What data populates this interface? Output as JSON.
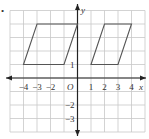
{
  "diagram": {
    "type": "coordinate-grid",
    "bullet": "•",
    "axes": {
      "x_label": "x",
      "y_label": "y",
      "origin_label": "O",
      "x_range": [
        -5,
        5
      ],
      "y_range": [
        -4,
        5
      ],
      "x_ticks": [
        {
          "value": -4,
          "label": "−4"
        },
        {
          "value": -3,
          "label": "−3"
        },
        {
          "value": -2,
          "label": "−2"
        },
        {
          "value": 1,
          "label": "1"
        },
        {
          "value": 2,
          "label": "2"
        },
        {
          "value": 3,
          "label": "3"
        },
        {
          "value": 4,
          "label": "4"
        }
      ],
      "y_ticks": [
        {
          "value": 1,
          "label": "1"
        },
        {
          "value": -2,
          "label": "−2"
        },
        {
          "value": -3,
          "label": "−3"
        }
      ]
    },
    "shapes": [
      {
        "name": "parallelogram-left",
        "vertices": [
          [
            -4,
            1
          ],
          [
            -1,
            1
          ],
          [
            0,
            4
          ],
          [
            -3,
            4
          ]
        ]
      },
      {
        "name": "parallelogram-right",
        "vertices": [
          [
            1,
            1
          ],
          [
            3,
            1
          ],
          [
            4,
            4
          ],
          [
            2,
            4
          ]
        ]
      }
    ],
    "colors": {
      "grid": "#c8c8c8",
      "axis": "#222222",
      "shape": "#555555"
    }
  }
}
